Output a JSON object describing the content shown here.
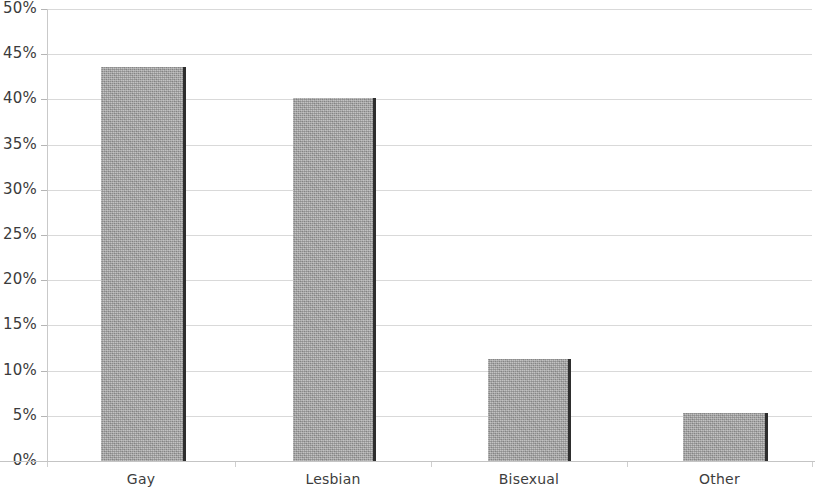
{
  "chart_data": {
    "type": "bar",
    "title": "",
    "subtitle": "",
    "xlabel": "",
    "ylabel": "",
    "categories": [
      "Gay",
      "Lesbian",
      "Bisexual",
      "Other"
    ],
    "values": [
      43.6,
      40.2,
      11.3,
      5.3
    ],
    "value_labels": [
      "43.6%",
      "40.2%",
      "11.3%",
      "5.3%"
    ],
    "ylim": [
      0,
      50
    ],
    "ytick_values": [
      0,
      5,
      10,
      15,
      20,
      25,
      30,
      35,
      40,
      45,
      50
    ],
    "ytick_labels": [
      "0%",
      "5%",
      "10%",
      "15%",
      "20%",
      "25%",
      "30%",
      "35%",
      "40%",
      "45%",
      "50%"
    ],
    "grid": true,
    "grid_axis": "y",
    "legend": false,
    "legend_position": "none",
    "series": [
      {
        "name": "",
        "values": [
          43.6,
          40.2,
          11.3,
          5.3
        ]
      }
    ],
    "bar_color": "#a9a9a9",
    "bar_edge_color": "#2e2e2e",
    "gridline_color": "#d9d9d9",
    "axis_color": "#c4c4c4",
    "text_color": "#3b3b3b",
    "background_color": "#ffffff",
    "annotations": []
  },
  "axis": {
    "y_ticks": [
      {
        "label": "50%",
        "value": 50
      },
      {
        "label": "45%",
        "value": 45
      },
      {
        "label": "40%",
        "value": 40
      },
      {
        "label": "35%",
        "value": 35
      },
      {
        "label": "30%",
        "value": 30
      },
      {
        "label": "25%",
        "value": 25
      },
      {
        "label": "20%",
        "value": 20
      },
      {
        "label": "15%",
        "value": 15
      },
      {
        "label": "10%",
        "value": 10
      },
      {
        "label": "5%",
        "value": 5
      },
      {
        "label": "0%",
        "value": 0
      }
    ],
    "x_ticks": [
      {
        "label": "Gay"
      },
      {
        "label": "Lesbian"
      },
      {
        "label": "Bisexual"
      },
      {
        "label": "Other"
      }
    ]
  }
}
